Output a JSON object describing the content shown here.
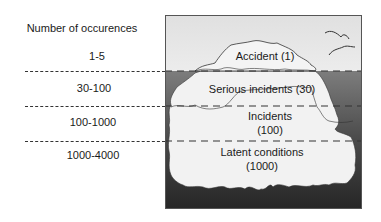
{
  "title": "Number of occurences",
  "ranges": [
    {
      "label": "1-5"
    },
    {
      "label": "30-100"
    },
    {
      "label": "100-1000"
    },
    {
      "label": "1000-4000"
    }
  ],
  "iceberg_levels": [
    {
      "name": "Accident",
      "count": "(1)",
      "text": "Accident (1)"
    },
    {
      "name": "Serious incidents",
      "count": "(30)",
      "text": "Serious incidents (30)"
    },
    {
      "name": "Incidents",
      "count": "(100)"
    },
    {
      "name": "Latent conditions",
      "count": "(1000)"
    }
  ],
  "colors": {
    "sky": "#e6e6e6",
    "water_top": "#7a7a7a",
    "water_bottom": "#2b2b2b",
    "ice": "#f2f2f2",
    "outline": "#333333"
  }
}
